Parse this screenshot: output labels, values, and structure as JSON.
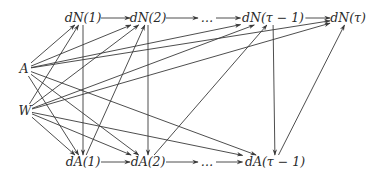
{
  "diagram": {
    "type": "causal-dag",
    "colors": {
      "line": "#3a3a3a",
      "text": "#2a2a2a",
      "background": "#ffffff"
    },
    "nodes": [
      {
        "id": "dN1",
        "label": "dN(1)",
        "x": 83,
        "y": 18
      },
      {
        "id": "dN2",
        "label": "dN(2)",
        "x": 148,
        "y": 18
      },
      {
        "id": "dNdots",
        "label": "…",
        "x": 207,
        "y": 18
      },
      {
        "id": "dNt1",
        "label": "dN(τ − 1)",
        "x": 273,
        "y": 18
      },
      {
        "id": "dNt",
        "label": "dN(τ)",
        "x": 348,
        "y": 18
      },
      {
        "id": "A",
        "label": "A",
        "x": 24,
        "y": 69
      },
      {
        "id": "W",
        "label": "W",
        "x": 25,
        "y": 111
      },
      {
        "id": "dA1",
        "label": "dA(1)",
        "x": 83,
        "y": 162
      },
      {
        "id": "dA2",
        "label": "dA(2)",
        "x": 148,
        "y": 162
      },
      {
        "id": "dAdots",
        "label": "…",
        "x": 207,
        "y": 162
      },
      {
        "id": "dAt1",
        "label": "dA(τ − 1)",
        "x": 275,
        "y": 162
      }
    ],
    "edges": [
      [
        "dN1",
        "dN2"
      ],
      [
        "dN2",
        "dNdots"
      ],
      [
        "dNdots",
        "dNt1"
      ],
      [
        "dNt1",
        "dNt"
      ],
      [
        "dA1",
        "dA2"
      ],
      [
        "dA2",
        "dAdots"
      ],
      [
        "dAdots",
        "dAt1"
      ],
      [
        "A",
        "dN1"
      ],
      [
        "A",
        "dN2"
      ],
      [
        "A",
        "dNt1"
      ],
      [
        "A",
        "dNt"
      ],
      [
        "A",
        "dA1"
      ],
      [
        "A",
        "dA2"
      ],
      [
        "A",
        "dAt1"
      ],
      [
        "W",
        "dN1"
      ],
      [
        "W",
        "dN2"
      ],
      [
        "W",
        "dNt1"
      ],
      [
        "W",
        "dNt"
      ],
      [
        "W",
        "dA1"
      ],
      [
        "W",
        "dA2"
      ],
      [
        "W",
        "dAt1"
      ],
      [
        "dN1",
        "dA1"
      ],
      [
        "dN2",
        "dA2"
      ],
      [
        "dNt1",
        "dAt1"
      ],
      [
        "dA1",
        "dN2"
      ],
      [
        "dA2",
        "dNt1"
      ],
      [
        "dAt1",
        "dNt"
      ],
      [
        "A",
        "dN1_b"
      ]
    ]
  }
}
